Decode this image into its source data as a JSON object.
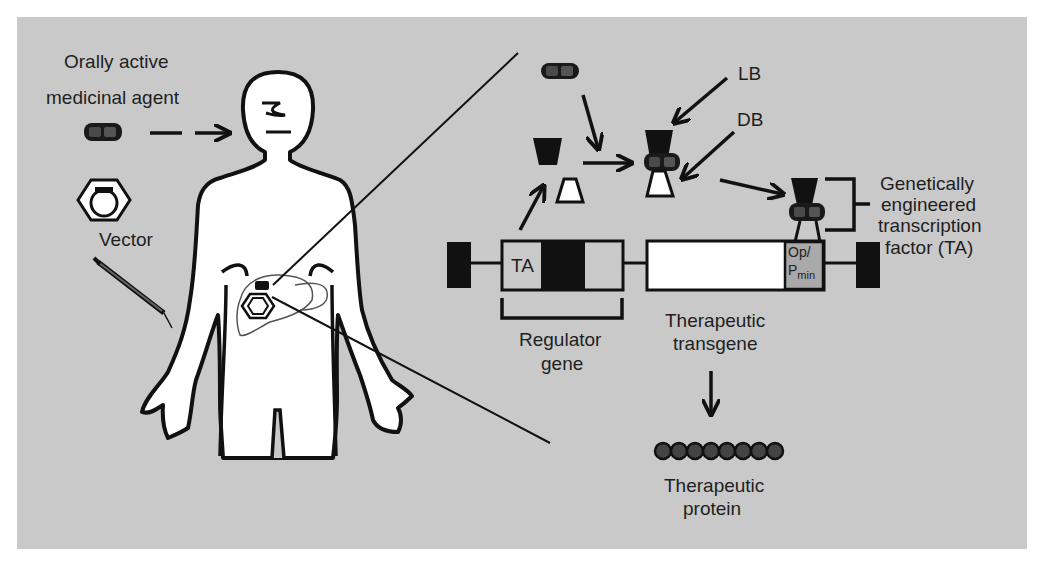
{
  "figure": {
    "background_color": "#c9c9c9",
    "labels": {
      "orally_active_line1": "Orally active",
      "orally_active_line2": "medicinal agent",
      "vector": "Vector",
      "lb": "LB",
      "db": "DB",
      "ta_factor_line1": "Genetically",
      "ta_factor_line2": "engineered",
      "ta_factor_line3": "transcription",
      "ta_factor_line4": "factor (TA)",
      "ta_box": "TA",
      "op": "Op/",
      "p": "P",
      "min": "min",
      "regulator_line1": "Regulator",
      "regulator_line2": "gene",
      "transgene_line1": "Therapeutic",
      "transgene_line2": "transgene",
      "protein_line1": "Therapeutic",
      "protein_line2": "protein"
    },
    "elements": [
      {
        "id": "human-figure",
        "type": "outline-body"
      },
      {
        "id": "pill",
        "type": "capsule",
        "color": "#3a3a3a"
      },
      {
        "id": "vector",
        "type": "hexagon-with-ring"
      },
      {
        "id": "syringe",
        "type": "injector"
      },
      {
        "id": "liver",
        "type": "organ-outline"
      },
      {
        "id": "transcription-factor",
        "type": "two-part-protein"
      },
      {
        "id": "gene-construct",
        "type": "dna-boxes"
      },
      {
        "id": "protein-chain",
        "type": "bead-chain",
        "beads": 8,
        "color": "#3d3d3d"
      }
    ]
  }
}
